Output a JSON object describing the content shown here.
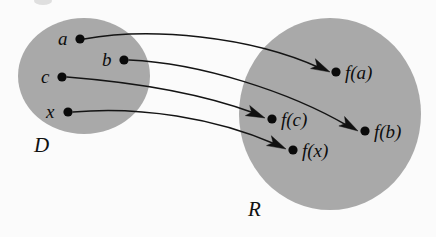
{
  "figure": {
    "kind": "function-mapping-diagram",
    "background_color": "#fbfbfb",
    "set_fill_color": "#a9a9a9",
    "ink_color": "#101010",
    "width": 436,
    "height": 237
  },
  "sets": {
    "domain": {
      "label": "D",
      "label_x": 34,
      "label_y": 152,
      "cx": 84,
      "cy": 76,
      "rx": 66,
      "ry": 58
    },
    "range": {
      "label": "R",
      "label_x": 248,
      "label_y": 216,
      "cx": 330,
      "cy": 114,
      "rx": 91,
      "ry": 96
    }
  },
  "domain_elements": [
    {
      "label": "a",
      "dot_x": 80,
      "dot_y": 39,
      "label_x": 58,
      "label_y": 45
    },
    {
      "label": "b",
      "dot_x": 124,
      "dot_y": 60,
      "label_x": 102,
      "label_y": 66
    },
    {
      "label": "c",
      "dot_x": 62,
      "dot_y": 77,
      "label_x": 41,
      "label_y": 83
    },
    {
      "label": "x",
      "dot_x": 68,
      "dot_y": 112,
      "label_x": 46,
      "label_y": 118
    }
  ],
  "range_elements": [
    {
      "label": "f(a)",
      "dot_x": 336,
      "dot_y": 72,
      "label_x": 345,
      "label_y": 79
    },
    {
      "label": "f(c)",
      "dot_x": 272,
      "dot_y": 119,
      "label_x": 281,
      "label_y": 126
    },
    {
      "label": "f(b)",
      "dot_x": 365,
      "dot_y": 131,
      "label_x": 374,
      "label_y": 138
    },
    {
      "label": "f(x)",
      "dot_x": 293,
      "dot_y": 150,
      "label_x": 302,
      "label_y": 157
    }
  ],
  "mappings": [
    {
      "name": "a-to-fa",
      "from": "a",
      "to": "f(a)",
      "path": "M 84 39 C 150 27, 250 36, 320 68",
      "arrow_tip_x": 330,
      "arrow_tip_y": 72,
      "arrow_angle": 26
    },
    {
      "name": "b-to-fb",
      "from": "b",
      "to": "f(b)",
      "path": "M 129 60 C 200 63, 290 92, 348 126",
      "arrow_tip_x": 358,
      "arrow_tip_y": 131,
      "arrow_angle": 31
    },
    {
      "name": "c-to-fc",
      "from": "c",
      "to": "f(c)",
      "path": "M 67 77 C 130 82, 200 93, 254 113",
      "arrow_tip_x": 265,
      "arrow_tip_y": 118,
      "arrow_angle": 23
    },
    {
      "name": "x-to-fx",
      "from": "x",
      "to": "f(x)",
      "path": "M 73 112 C 140 106, 215 118, 275 144",
      "arrow_tip_x": 286,
      "arrow_tip_y": 149,
      "arrow_angle": 26
    }
  ]
}
